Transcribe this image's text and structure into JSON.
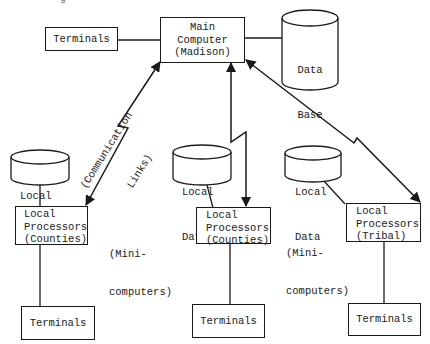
{
  "figure_fragment": "g",
  "nodes": {
    "main_computer": {
      "lines": [
        "Main",
        "Computer",
        "(Madison)"
      ]
    },
    "top_terminals": {
      "label": "Terminals"
    },
    "data_base": {
      "lines": [
        "Data",
        "Base"
      ]
    },
    "local_data_left": {
      "lines": [
        "Local",
        "Data"
      ]
    },
    "local_data_middle": {
      "lines": [
        "Local",
        "Data"
      ]
    },
    "local_data_right": {
      "lines": [
        "Local",
        "Data"
      ]
    },
    "processor_left": {
      "lines": [
        "Local",
        "Processors",
        "(Counties)"
      ]
    },
    "processor_middle": {
      "lines": [
        "Local",
        "Processors",
        "(Counties)"
      ]
    },
    "processor_right": {
      "lines": [
        "Local",
        "Processors",
        "(Tribal)"
      ]
    },
    "terminals_left": {
      "label": "Terminals"
    },
    "terminals_middle": {
      "label": "Terminals"
    },
    "terminals_right": {
      "label": "Terminals"
    }
  },
  "annotations": {
    "communication_links": [
      "(Communication",
      "Links)"
    ],
    "minicomputers_1": [
      "(Mini-",
      "computers)"
    ],
    "minicomputers_2": [
      "(Mini-",
      "computers)"
    ]
  },
  "edges": [
    {
      "from": "top_terminals",
      "to": "main_computer",
      "type": "line"
    },
    {
      "from": "main_computer",
      "to": "data_base",
      "type": "line"
    },
    {
      "from": "main_computer",
      "to": "processor_left",
      "type": "bidirectional-communication-link"
    },
    {
      "from": "main_computer",
      "to": "processor_middle",
      "type": "bidirectional-communication-link"
    },
    {
      "from": "main_computer",
      "to": "processor_right",
      "type": "bidirectional-communication-link"
    },
    {
      "from": "local_data_left",
      "to": "processor_left",
      "type": "line"
    },
    {
      "from": "local_data_middle",
      "to": "processor_middle",
      "type": "line"
    },
    {
      "from": "local_data_right",
      "to": "processor_right",
      "type": "line"
    },
    {
      "from": "processor_left",
      "to": "terminals_left",
      "type": "line"
    },
    {
      "from": "processor_middle",
      "to": "terminals_middle",
      "type": "line"
    },
    {
      "from": "processor_right",
      "to": "terminals_right",
      "type": "line"
    }
  ]
}
